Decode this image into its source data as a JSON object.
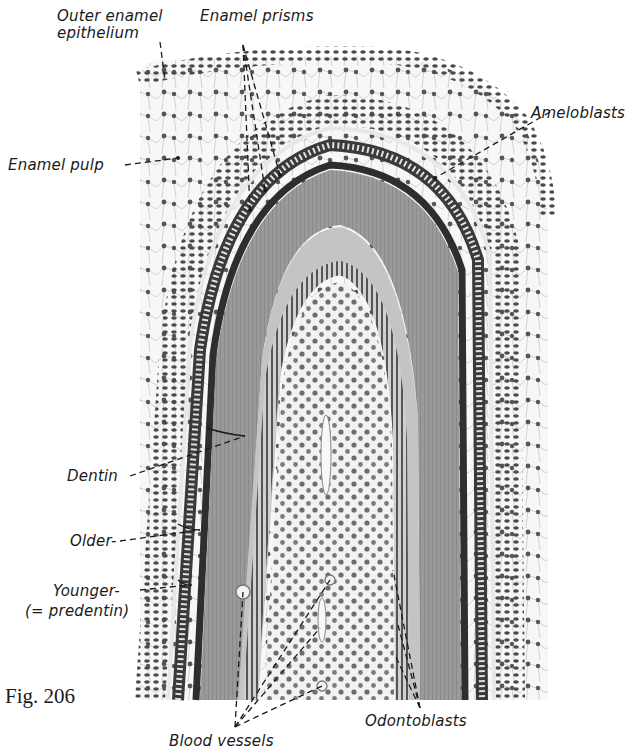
{
  "figure": {
    "number": "Fig. 206"
  },
  "labels": {
    "outer_enamel_epithelium_line1": "Outer enamel",
    "outer_enamel_epithelium_line2": "epithelium",
    "enamel_prisms": "Enamel prisms",
    "ameloblasts": "Ameloblasts",
    "enamel_pulp": "Enamel pulp",
    "dentin": "Dentin",
    "older": "Older-",
    "younger": "Younger-",
    "predentin": "(= predentin)",
    "blood_vessels": "Blood vessels",
    "odontoblasts": "Odontoblasts"
  },
  "colors": {
    "ink": "#1a1a1a",
    "nuclei": "#4a4a4a",
    "enamel_dark": "#3a3a3a",
    "dentin_mid": "#8a8a8a",
    "predentin_light": "#b8b8b8",
    "pulp_bg": "#f2f2f2",
    "reticulum_bg": "#f6f6f6"
  }
}
